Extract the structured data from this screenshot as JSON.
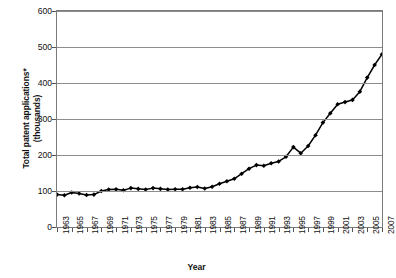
{
  "chart_data": {
    "type": "line",
    "title": "",
    "xlabel": "Year",
    "ylabel": "Total patent applications* (thousands)",
    "ylabel_lines": [
      "Total patent applications*",
      "(thousands)"
    ],
    "ylim": [
      0,
      600
    ],
    "ytick_values": [
      0,
      100,
      200,
      300,
      400,
      500,
      600
    ],
    "ytick_labels": [
      "0",
      "100",
      "200",
      "300",
      "400",
      "500",
      "600"
    ],
    "grid": true,
    "legend": "none",
    "marker": "diamond",
    "line_color": "#000000",
    "marker_color": "#000000",
    "grid_color": "#8d8d8d",
    "xlim": [
      1963,
      2007
    ],
    "xtick_labels": [
      "1963",
      "1965",
      "1967",
      "1969",
      "1971",
      "1973",
      "1975",
      "1977",
      "1979",
      "1981",
      "1983",
      "1985",
      "1987",
      "1989",
      "1991",
      "1993",
      "1995",
      "1997",
      "1999",
      "2001",
      "2003",
      "2005",
      "2007"
    ],
    "x": [
      1963,
      1964,
      1965,
      1966,
      1967,
      1968,
      1969,
      1970,
      1971,
      1972,
      1973,
      1974,
      1975,
      1976,
      1977,
      1978,
      1979,
      1980,
      1981,
      1982,
      1983,
      1984,
      1985,
      1986,
      1987,
      1988,
      1989,
      1990,
      1991,
      1992,
      1993,
      1994,
      1995,
      1996,
      1997,
      1998,
      1999,
      2000,
      2001,
      2002,
      2003,
      2004,
      2005,
      2006,
      2007
    ],
    "values": [
      90,
      88,
      96,
      93,
      89,
      90,
      100,
      104,
      105,
      102,
      108,
      106,
      104,
      108,
      106,
      104,
      105,
      105,
      109,
      111,
      107,
      112,
      120,
      127,
      134,
      148,
      162,
      172,
      170,
      177,
      182,
      195,
      222,
      205,
      225,
      255,
      290,
      316,
      341,
      347,
      353,
      376,
      415,
      450,
      480
    ],
    "series": [
      {
        "name": "Total patent applications",
        "values": [
          90,
          88,
          96,
          93,
          89,
          90,
          100,
          104,
          105,
          102,
          108,
          106,
          104,
          108,
          106,
          104,
          105,
          105,
          109,
          111,
          107,
          112,
          120,
          127,
          134,
          148,
          162,
          172,
          170,
          177,
          182,
          195,
          222,
          205,
          225,
          255,
          290,
          316,
          341,
          347,
          353,
          376,
          415,
          450,
          480
        ]
      }
    ]
  }
}
